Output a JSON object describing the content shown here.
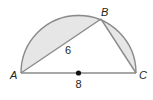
{
  "diagram": {
    "type": "semicircle-inscribed-triangle",
    "points": {
      "A": {
        "label": "A"
      },
      "B": {
        "label": "B"
      },
      "C": {
        "label": "C"
      }
    },
    "measures": {
      "AB": "6",
      "AC": "8"
    },
    "colors": {
      "stroke": "#8a8a8a",
      "shaded": "#e6e6e6",
      "center_dot": "#111111",
      "text": "#231f20"
    }
  }
}
